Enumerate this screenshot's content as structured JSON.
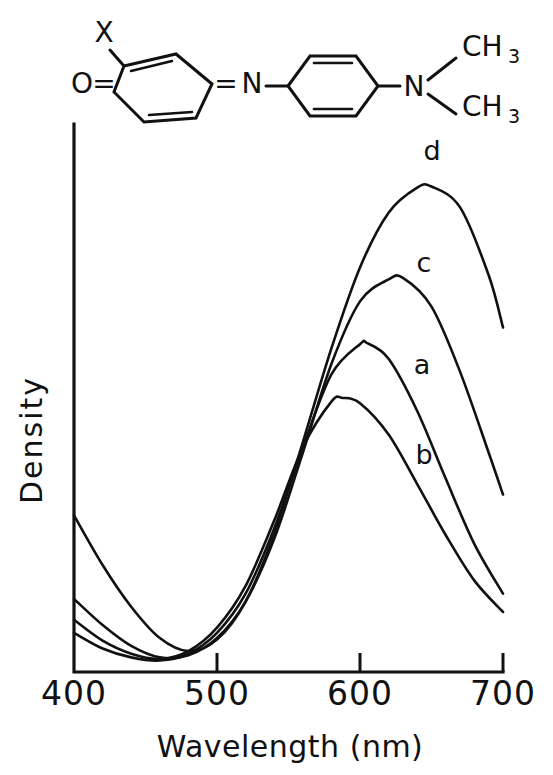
{
  "figure": {
    "title_structure": "quinone-imine dye structure",
    "molecule": {
      "substituent_label": "X",
      "oxygen_label": "O",
      "imine_nitrogen_label": "N",
      "amine_nitrogen_label": "N",
      "methyl_top": "CH",
      "methyl_top_sub": "3",
      "methyl_bottom": "CH",
      "methyl_bottom_sub": "3",
      "double_bond_left": "=",
      "double_bond_right": "="
    }
  },
  "chart_data": {
    "type": "line",
    "title": "",
    "xlabel": "Wavelength (nm)",
    "ylabel": "Density",
    "xlim": [
      400,
      700
    ],
    "ylim": [
      0,
      1
    ],
    "xticks": [
      400,
      500,
      600,
      700
    ],
    "xticklabels": [
      "400",
      "500",
      "600",
      "700"
    ],
    "yticks": [],
    "yticklabels": [],
    "grid": false,
    "legend_position": "inline-curve-labels",
    "annotations": [
      "a",
      "b",
      "c",
      "d"
    ],
    "series": [
      {
        "name": "a",
        "label": "a",
        "peak_wavelength_nm": 605,
        "peak_density": 0.63,
        "x": [
          400,
          420,
          440,
          460,
          480,
          500,
          520,
          540,
          560,
          580,
          600,
          605,
          620,
          640,
          660,
          680,
          700
        ],
        "y": [
          0.075,
          0.045,
          0.028,
          0.022,
          0.035,
          0.075,
          0.15,
          0.275,
          0.43,
          0.57,
          0.628,
          0.63,
          0.6,
          0.5,
          0.37,
          0.245,
          0.15
        ]
      },
      {
        "name": "b",
        "label": "b",
        "peak_wavelength_nm": 588,
        "peak_density": 0.525,
        "x": [
          400,
          420,
          440,
          460,
          480,
          500,
          520,
          540,
          560,
          580,
          588,
          600,
          620,
          640,
          660,
          680,
          700
        ],
        "y": [
          0.1,
          0.06,
          0.035,
          0.025,
          0.04,
          0.085,
          0.165,
          0.29,
          0.43,
          0.518,
          0.525,
          0.515,
          0.455,
          0.36,
          0.262,
          0.175,
          0.115
        ]
      },
      {
        "name": "c",
        "label": "c",
        "peak_wavelength_nm": 630,
        "peak_density": 0.755,
        "x": [
          400,
          420,
          440,
          460,
          480,
          500,
          520,
          540,
          560,
          580,
          600,
          620,
          630,
          650,
          670,
          690,
          700
        ],
        "y": [
          0.14,
          0.09,
          0.05,
          0.028,
          0.032,
          0.065,
          0.135,
          0.255,
          0.42,
          0.59,
          0.71,
          0.752,
          0.755,
          0.7,
          0.575,
          0.42,
          0.34
        ]
      },
      {
        "name": "d",
        "label": "d",
        "peak_wavelength_nm": 650,
        "peak_density": 0.93,
        "x": [
          400,
          420,
          440,
          460,
          480,
          500,
          520,
          540,
          560,
          580,
          600,
          620,
          640,
          650,
          670,
          690,
          700
        ],
        "y": [
          0.3,
          0.205,
          0.125,
          0.065,
          0.04,
          0.062,
          0.135,
          0.265,
          0.44,
          0.62,
          0.775,
          0.88,
          0.928,
          0.93,
          0.89,
          0.76,
          0.66
        ]
      }
    ]
  }
}
